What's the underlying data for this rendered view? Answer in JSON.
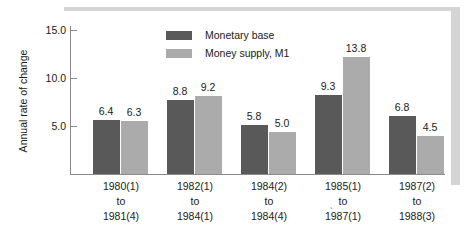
{
  "chart_data": {
    "type": "bar",
    "title": "",
    "subtitle": "",
    "xlabel": "",
    "ylabel": "Annual rate of change",
    "ylim": [
      0,
      17.5
    ],
    "yticks": [
      "5.0",
      "10.0",
      "15.0"
    ],
    "ytick_values": [
      5.0,
      10.0,
      15.0
    ],
    "grid": false,
    "legend_position": "top-center",
    "categories": [
      "1980(1)\nto\n1981(4)",
      "1982(1)\nto\n1984(1)",
      "1984(2)\nto\n1984(4)",
      "1985(1)\nto\n1987(1)",
      "1987(2)\nto\n1988(3)"
    ],
    "series": [
      {
        "name": "Monetary base",
        "color": "#595959",
        "values": [
          6.4,
          8.8,
          5.8,
          9.3,
          6.8
        ],
        "labels": [
          "6.4",
          "8.8",
          "5.8",
          "9.3",
          "6.8"
        ]
      },
      {
        "name": "Money supply, M1",
        "color": "#ababab",
        "values": [
          6.3,
          9.2,
          5.0,
          13.8,
          4.5
        ],
        "labels": [
          "6.3",
          "9.2",
          "5.0",
          "13.8",
          "4.5"
        ]
      }
    ]
  },
  "axis": {
    "y_title": "Annual rate of change",
    "ticks": [
      {
        "label": "15.0",
        "value": 15.0
      },
      {
        "label": "10.0",
        "value": 10.0
      },
      {
        "label": "5.0",
        "value": 5.0
      }
    ]
  },
  "legend": {
    "items": [
      {
        "label": "Monetary base",
        "color": "#595959"
      },
      {
        "label": "Money supply, M1",
        "color": "#ababab"
      }
    ]
  },
  "categories": [
    {
      "line1": "1980(1)",
      "line2": "to",
      "line3": "1981(4)"
    },
    {
      "line1": "1982(1)",
      "line2": "to",
      "line3": "1984(1)"
    },
    {
      "line1": "1984(2)",
      "line2": "to",
      "line3": "1984(4)"
    },
    {
      "line1": "1985(1)",
      "line2": "to",
      "line3": "1987(1)"
    },
    {
      "line1": "1987(2)",
      "line2": "to",
      "line3": "1988(3)"
    }
  ],
  "bars": [
    {
      "a_value": "6.4",
      "b_value": "6.3"
    },
    {
      "a_value": "8.8",
      "b_value": "9.2"
    },
    {
      "a_value": "5.8",
      "b_value": "5.0"
    },
    {
      "a_value": "9.3",
      "b_value": "13.8"
    },
    {
      "a_value": "6.8",
      "b_value": "4.5"
    }
  ],
  "colors": {
    "series_dark": "#595959",
    "series_light": "#ababab",
    "axis": "#8a8a8a",
    "frame_shadow": "#d5d5d5",
    "text": "#1a1a1a",
    "background": "#ffffff"
  },
  "stray_mark": "`"
}
